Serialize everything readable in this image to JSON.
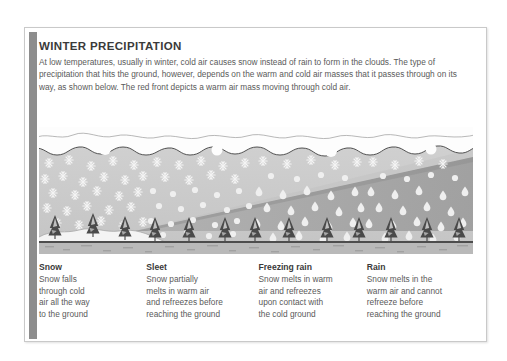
{
  "card": {
    "accent_color": "#8d8d8d",
    "border_color": "#c9c9c9",
    "background": "#ffffff"
  },
  "header": {
    "title": "WINTER PRECIPITATION",
    "paragraph": "At low temperatures, usually in winter, cold air causes snow instead of rain to form in the clouds. The type of precipitation that hits the ground, however, depends on the warm and cold air masses that it passes through on its way, as shown below. The red front depicts a warm air mass moving through cold air."
  },
  "illustration": {
    "alt": "Cross-section diagram of winter precipitation types",
    "colors": {
      "cold_air": "#c9c9c9",
      "warm_air": "#a8a8a8",
      "cloud": "#fdfdfd",
      "cloud_outline": "#4a4a4a",
      "ground": "#b4b4b4",
      "snow_cover": "#f2f2f2",
      "tree": "#4a4a4a",
      "precip": "#f0f0f0"
    },
    "zones": [
      {
        "name": "snow",
        "precip_type": "snowflake"
      },
      {
        "name": "sleet",
        "precip_type": "snowflake-and-drop"
      },
      {
        "name": "freezing-rain",
        "precip_type": "drop"
      },
      {
        "name": "rain",
        "precip_type": "drop"
      }
    ],
    "front_label": "warm front wedge"
  },
  "captions": [
    {
      "title": "Snow",
      "lines": [
        "Snow falls",
        "through cold",
        "air all the way",
        "to the ground"
      ]
    },
    {
      "title": "Sleet",
      "lines": [
        "Snow partially",
        "melts in warm air",
        "and refreezes before",
        "reaching the ground"
      ]
    },
    {
      "title": "Freezing rain",
      "lines": [
        "Snow melts in warm",
        "air and refreezes",
        "upon contact with",
        "the cold ground"
      ]
    },
    {
      "title": "Rain",
      "lines": [
        "Snow melts in the",
        "warm air and cannot",
        "refreeze before",
        "reaching the ground"
      ]
    }
  ]
}
